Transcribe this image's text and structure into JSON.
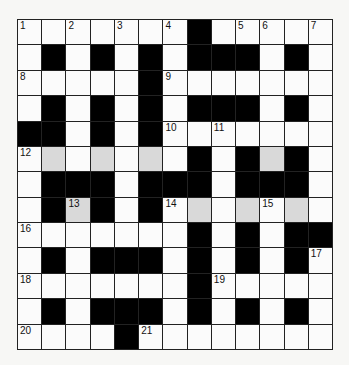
{
  "puzzle": {
    "rows": 13,
    "cols": 13,
    "grid": [
      "....... .....",
      ".#.#.#.###.#.",
      ".....#.......",
      ".#.#.#.###.#.",
      "##.#.#.......",
      ".g.g.g.#.#g#.",
      ".###.###.###.",
      ".#g#.#.g.g.g.",
      ".......#.#.##",
      ".#.###.#.#.#.",
      ".......#.....",
      ".#.###.#.#.#.",
      "....#........"
    ],
    "legend": {
      ".": "white",
      "#": "black",
      "g": "shaded",
      " ": "black"
    },
    "numbers": [
      {
        "r": 0,
        "c": 0,
        "n": "1"
      },
      {
        "r": 0,
        "c": 2,
        "n": "2"
      },
      {
        "r": 0,
        "c": 4,
        "n": "3"
      },
      {
        "r": 0,
        "c": 6,
        "n": "4"
      },
      {
        "r": 0,
        "c": 9,
        "n": "5"
      },
      {
        "r": 0,
        "c": 10,
        "n": "6"
      },
      {
        "r": 0,
        "c": 12,
        "n": "7"
      },
      {
        "r": 2,
        "c": 0,
        "n": "8"
      },
      {
        "r": 2,
        "c": 6,
        "n": "9"
      },
      {
        "r": 4,
        "c": 6,
        "n": "10"
      },
      {
        "r": 4,
        "c": 8,
        "n": "11"
      },
      {
        "r": 5,
        "c": 0,
        "n": "12"
      },
      {
        "r": 7,
        "c": 2,
        "n": "13"
      },
      {
        "r": 7,
        "c": 6,
        "n": "14"
      },
      {
        "r": 7,
        "c": 10,
        "n": "15"
      },
      {
        "r": 8,
        "c": 0,
        "n": "16"
      },
      {
        "r": 9,
        "c": 12,
        "n": "17"
      },
      {
        "r": 10,
        "c": 0,
        "n": "18"
      },
      {
        "r": 10,
        "c": 8,
        "n": "19"
      },
      {
        "r": 12,
        "c": 0,
        "n": "20"
      },
      {
        "r": 12,
        "c": 5,
        "n": "21"
      }
    ]
  }
}
